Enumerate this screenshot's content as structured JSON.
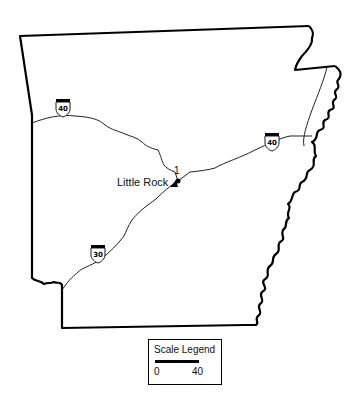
{
  "map": {
    "region": "Arkansas",
    "city": {
      "name": "Little Rock",
      "marker_label": "1"
    },
    "interstates": [
      {
        "number": "40",
        "segment": "west"
      },
      {
        "number": "40",
        "segment": "east"
      },
      {
        "number": "30",
        "segment": "southwest"
      }
    ],
    "legend": {
      "title": "Scale Legend",
      "min_label": "0",
      "max_label": "40"
    },
    "colors": {
      "border": "#000000",
      "road": "#222222",
      "background": "#ffffff"
    }
  }
}
